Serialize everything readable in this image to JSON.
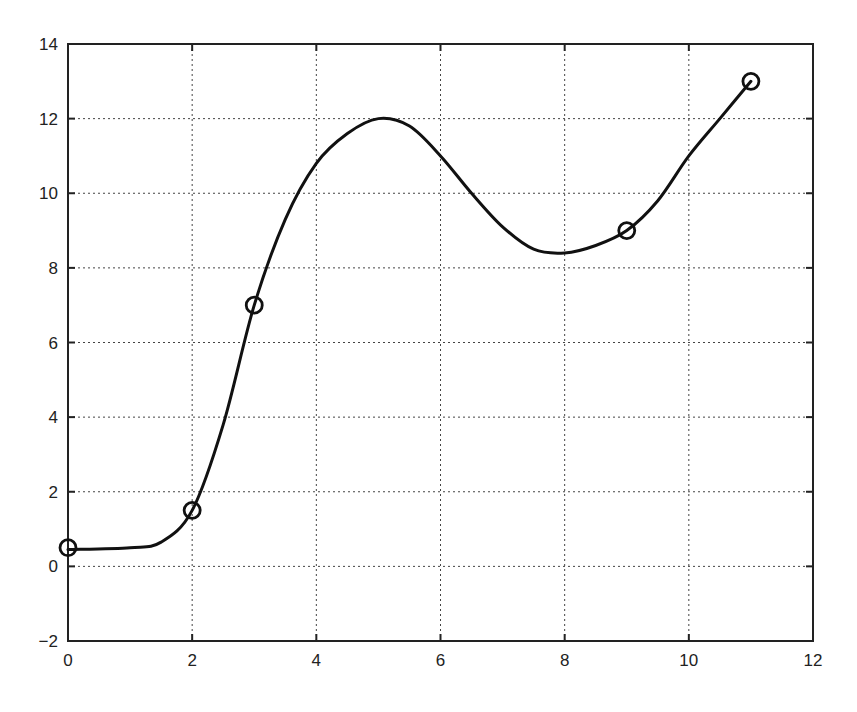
{
  "chart_data": {
    "type": "line",
    "title": "",
    "xlabel": "",
    "ylabel": "",
    "xlim": [
      0,
      12
    ],
    "ylim": [
      -2,
      14
    ],
    "grid": true,
    "x_ticks": [
      0,
      2,
      4,
      6,
      8,
      10,
      12
    ],
    "y_ticks": [
      -2,
      0,
      2,
      4,
      6,
      8,
      10,
      12,
      14
    ],
    "x_tick_labels": [
      "0",
      "2",
      "4",
      "6",
      "8",
      "10",
      "12"
    ],
    "y_tick_labels": [
      "−2",
      "0",
      "2",
      "4",
      "6",
      "8",
      "10",
      "12",
      "14"
    ],
    "series": [
      {
        "name": "data points",
        "style": "circle markers",
        "x": [
          0,
          2,
          3,
          9,
          11
        ],
        "y": [
          0.5,
          1.5,
          7,
          9,
          13
        ]
      },
      {
        "name": "smooth interpolating curve",
        "style": "solid line",
        "x": [
          0,
          1,
          1.5,
          2,
          2.5,
          3,
          3.5,
          4,
          4.5,
          5,
          5.5,
          6,
          6.5,
          7,
          7.5,
          8,
          8.5,
          9,
          9.5,
          10,
          10.5,
          11
        ],
        "y": [
          0.45,
          0.5,
          0.65,
          1.5,
          3.8,
          7.0,
          9.3,
          10.8,
          11.6,
          12.0,
          11.8,
          11.0,
          10.0,
          9.1,
          8.5,
          8.4,
          8.6,
          9.0,
          9.8,
          11.0,
          12.0,
          13.0
        ]
      }
    ],
    "colors": {
      "line": "#111111",
      "grid": "#444444",
      "axes": "#222222",
      "background": "#ffffff"
    }
  }
}
